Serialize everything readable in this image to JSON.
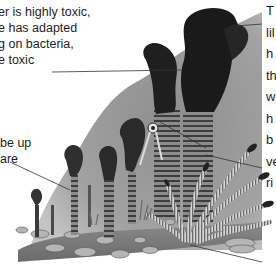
{
  "figure": {
    "colors": {
      "background": "#ffffff",
      "water_plume": "#9a9a9a",
      "smoke": "#2a2a2a",
      "seabed": "#7d7d7d",
      "text": "#1e1e1e",
      "leader_line": "#333333"
    }
  },
  "annotations": {
    "toxic": {
      "lines": [
        "er is highly toxic,",
        "e has adapted",
        "g on bacteria,",
        "e toxic"
      ]
    },
    "up": {
      "lines": [
        "be up",
        "are"
      ]
    },
    "right": {
      "lines": [
        "T",
        "lil",
        "h",
        "th",
        "w",
        "h",
        "b",
        "ve",
        "ri"
      ]
    }
  }
}
